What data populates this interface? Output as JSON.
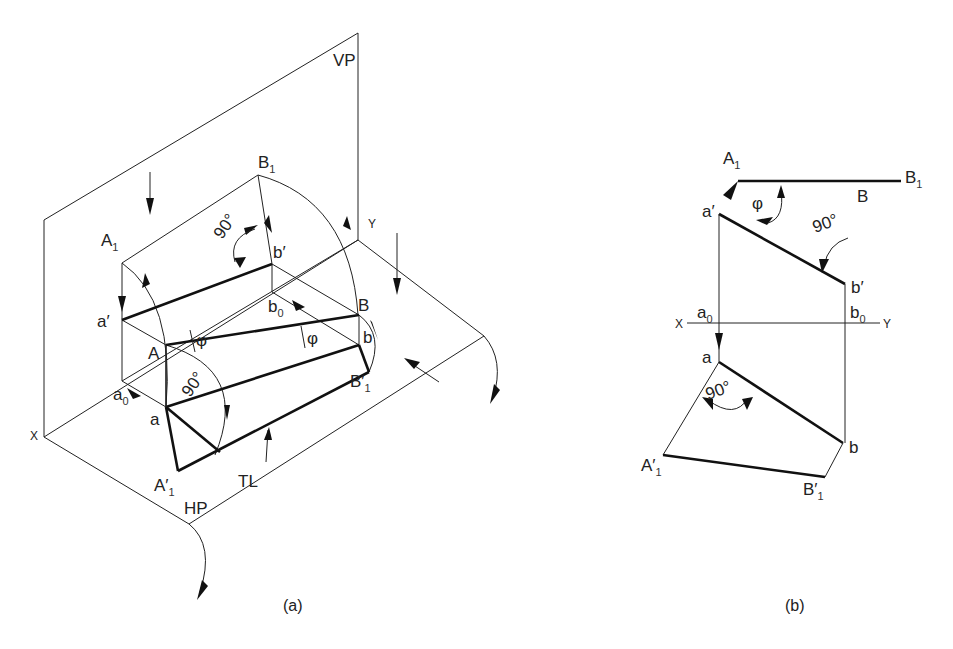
{
  "figure_a": {
    "caption": "(a)",
    "planes": {
      "vertical": "VP",
      "horizontal": "HP"
    },
    "axis": {
      "x": "X",
      "y": "Y"
    },
    "points": {
      "A1": "A",
      "A1_sub": "1",
      "B1": "B",
      "B1_sub": "1",
      "a_prime": "a′",
      "b_prime": "b′",
      "A": "A",
      "B": "B",
      "a0": "a",
      "a0_sub": "0",
      "b0": "b",
      "b0_sub": "0",
      "a": "a",
      "b": "b",
      "A1_prime": "A′",
      "A1_prime_sub": "1",
      "B1_prime": "B′",
      "B1_prime_sub": "1"
    },
    "angles": {
      "right_angle_top": "90°",
      "right_angle_bottom": "90°",
      "phi_top": "φ",
      "phi_mid": "φ"
    },
    "true_length": "TL"
  },
  "figure_b": {
    "caption": "(b)",
    "axis": {
      "x": "X",
      "y": "Y"
    },
    "points": {
      "A1": "A",
      "A1_sub": "1",
      "B1": "B",
      "B1_sub": "1",
      "B": "B",
      "a_prime": "a′",
      "b_prime": "b′",
      "a0": "a",
      "a0_sub": "0",
      "b0": "b",
      "b0_sub": "0",
      "a": "a",
      "b": "b",
      "A1_prime": "A′",
      "A1_prime_sub": "1",
      "B1_prime": "B′",
      "B1_prime_sub": "1"
    },
    "angles": {
      "phi": "φ",
      "right_angle_top": "90°",
      "right_angle_bottom": "90°"
    }
  }
}
